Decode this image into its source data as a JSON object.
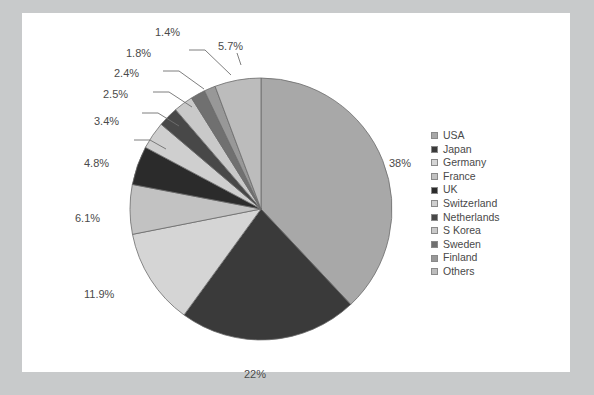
{
  "chart_data": {
    "type": "pie",
    "title": "",
    "categories": [
      "USA",
      "Japan",
      "Germany",
      "France",
      "UK",
      "Switzerland",
      "Netherlands",
      "S Korea",
      "Sweden",
      "Finland",
      "Others"
    ],
    "values": [
      38,
      22,
      11.9,
      6.1,
      4.8,
      3.4,
      2.5,
      2.4,
      1.8,
      1.4,
      5.7
    ],
    "value_labels": [
      "38%",
      "22%",
      "11.9%",
      "6.1%",
      "4.8%",
      "3.4%",
      "2.5%",
      "2.4%",
      "1.8%",
      "1.4%",
      "5.7%"
    ],
    "colors": [
      "#a8a8a8",
      "#3a3a3a",
      "#d5d5d5",
      "#c2c2c2",
      "#2b2b2b",
      "#cfcfcf",
      "#484848",
      "#c9c9c9",
      "#707070",
      "#989898",
      "#bcbcbc"
    ],
    "legend_position": "right",
    "grid": false,
    "start_angle_deg": 90,
    "direction": "clockwise",
    "xlabel": "",
    "ylabel": ""
  },
  "legend": {
    "items": [
      {
        "label": "USA"
      },
      {
        "label": "Japan"
      },
      {
        "label": "Germany"
      },
      {
        "label": "France"
      },
      {
        "label": "UK"
      },
      {
        "label": "Switzerland"
      },
      {
        "label": "Netherlands"
      },
      {
        "label": "S Korea"
      },
      {
        "label": "Sweden"
      },
      {
        "label": "Finland"
      },
      {
        "label": "Others"
      }
    ]
  },
  "labels": {
    "usa": "38%",
    "japan": "22%",
    "germany": "11.9%",
    "france": "6.1%",
    "uk": "4.8%",
    "switzerland": "3.4%",
    "netherlands": "2.5%",
    "skorea": "2.4%",
    "sweden": "1.8%",
    "finland": "1.4%",
    "others": "5.7%"
  },
  "style": {
    "page_background": "#ffffff",
    "frame_background": "#c8cacb",
    "label_color": "#4a4a4a",
    "slice_outline": "#6b6b6b"
  }
}
